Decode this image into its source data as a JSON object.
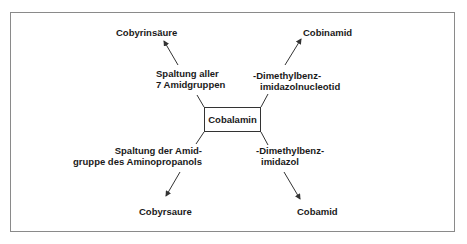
{
  "diagram": {
    "center": "Cobalamin",
    "branches": [
      {
        "product": "Cobyrinsäure",
        "reaction_line1": "Spaltung aller",
        "reaction_line2": "7 Amidgruppen"
      },
      {
        "product": "Cobinamid",
        "reaction_line1": "-Dimethylbenz-",
        "reaction_line2": "imidazolnucleotid"
      },
      {
        "product": "Cobyrsaure",
        "reaction_line1": "Spaltung der Amid-",
        "reaction_line2": "gruppe des Aminopropanols"
      },
      {
        "product": "Cobamid",
        "reaction_line1": "-Dimethylbenz-",
        "reaction_line2": "imidazol"
      }
    ],
    "colors": {
      "line": "#333333",
      "frame": "#8a8a8a",
      "text": "#1a1a1a"
    }
  }
}
